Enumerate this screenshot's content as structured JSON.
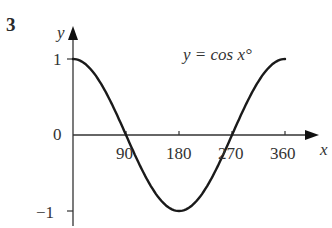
{
  "question_number": "3",
  "chart_data": {
    "type": "line",
    "title": "",
    "annotation": "y = cos x°",
    "xlabel": "x",
    "ylabel": "y",
    "x_ticks": [
      90,
      180,
      270,
      360
    ],
    "y_ticks": [
      1,
      0,
      -1
    ],
    "xlim": [
      0,
      360
    ],
    "ylim": [
      -1,
      1
    ],
    "grid": false,
    "series": [
      {
        "name": "y = cos x°",
        "x": [
          0,
          30,
          60,
          90,
          120,
          150,
          180,
          210,
          240,
          270,
          300,
          330,
          360
        ],
        "y": [
          1,
          0.866,
          0.5,
          0,
          -0.5,
          -0.866,
          -1,
          -0.866,
          -0.5,
          0,
          0.5,
          0.866,
          1
        ]
      }
    ]
  },
  "labels": {
    "x_axis": "x",
    "y_axis": "y",
    "equation": "y = cos x°",
    "x_tick_90": "90",
    "x_tick_180": "180",
    "x_tick_270": "270",
    "x_tick_360": "360",
    "y_tick_1": "1",
    "y_tick_0": "0",
    "y_tick_neg1": "−1"
  }
}
